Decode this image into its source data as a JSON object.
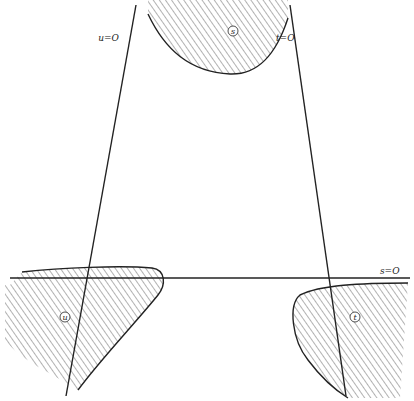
{
  "figure": {
    "type": "line-arrangement-diagram",
    "lines": [
      {
        "id": "u",
        "label": "u=O",
        "from": [
          136,
          5
        ],
        "to": [
          66,
          396
        ]
      },
      {
        "id": "t",
        "label": "t=O",
        "from": [
          290,
          5
        ],
        "to": [
          346,
          396
        ]
      },
      {
        "id": "s",
        "label": "s=O",
        "from": [
          10,
          278
        ],
        "to": [
          410,
          278
        ]
      }
    ],
    "regions": [
      {
        "id": "s",
        "label": "s",
        "position": "top"
      },
      {
        "id": "u",
        "label": "u",
        "position": "bottom-left"
      },
      {
        "id": "t",
        "label": "t",
        "position": "bottom-right"
      }
    ],
    "crossing_point": [
      212,
      145
    ],
    "colors": {
      "stroke": "#222222",
      "hatch": "#555555",
      "background": "#ffffff"
    }
  }
}
